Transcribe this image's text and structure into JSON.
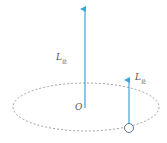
{
  "diagram": {
    "labels": {
      "big_L": "L",
      "big_L_sub": "总",
      "small_L": "L",
      "small_L_sub": "总",
      "origin": "O"
    },
    "colors": {
      "arrow": "#3ba7d9",
      "ellipse": "#888888",
      "particle": "#4a6a80",
      "text": "#555555"
    }
  }
}
